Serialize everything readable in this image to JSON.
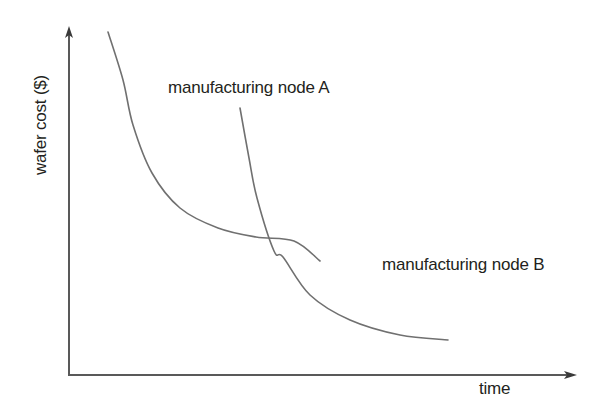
{
  "figure": {
    "background_color": "#ffffff",
    "width": 600,
    "height": 413
  },
  "axes": {
    "y_axis_label": "wafer cost ($)",
    "x_axis_label": "time",
    "axis_color": "#595959",
    "origin": {
      "x": 69,
      "y": 375
    },
    "y_axis_top": {
      "x": 69,
      "y": 29
    },
    "x_axis_end": {
      "x": 576,
      "y": 375
    },
    "arrowheads": "both-ends-outward"
  },
  "annotations": {
    "node_a_label": "manufacturing node A",
    "node_b_label": "manufacturing node B",
    "text_color": "#231f20"
  },
  "chart_data": {
    "type": "line",
    "title": "",
    "xlabel": "time",
    "ylabel": "wafer cost ($)",
    "grid": false,
    "legend": "inline-annotations",
    "axis_ticks": "none",
    "axis_scale": "qualitative",
    "xlim": [
      0,
      1
    ],
    "ylim": [
      0,
      1
    ],
    "curve_color": "#707070",
    "curve_width": 1.6,
    "series": [
      {
        "name": "manufacturing node A",
        "description": "learning-curve: wafer cost falls steeply then flattens; starts earlier in time at highest cost and settles to an intermediate cost plateau",
        "label_position": {
          "x": 168,
          "y": 78
        },
        "x": [
          0.077,
          0.1,
          0.121,
          0.16,
          0.219,
          0.298,
          0.377,
          0.456,
          0.496
        ],
        "y": [
          0.938,
          0.8,
          0.671,
          0.534,
          0.433,
          0.376,
          0.35,
          0.34,
          0.33
        ],
        "points_px": [
          [
            108,
            32
          ],
          [
            123,
            80
          ],
          [
            133,
            125
          ],
          [
            152,
            173
          ],
          [
            180,
            208
          ],
          [
            218,
            228
          ],
          [
            256,
            237
          ],
          [
            294,
            241
          ],
          [
            320,
            261
          ]
        ]
      },
      {
        "name": "manufacturing node B",
        "description": "learning-curve of the next node: starts later and lower than node A's start, drops steeply, crosses node A, and settles at a lower cost plateau",
        "label_position": {
          "x": 382,
          "y": 255
        },
        "x": [
          0.337,
          0.356,
          0.372,
          0.405,
          0.423,
          0.476,
          0.555,
          0.653,
          0.748
        ],
        "y": [
          0.716,
          0.572,
          0.457,
          0.305,
          0.255,
          0.174,
          0.118,
          0.076,
          0.065
        ],
        "points_px": [
          [
            240,
            108
          ],
          [
            249,
            158
          ],
          [
            257,
            198
          ],
          [
            274,
            251
          ],
          [
            283,
            257
          ],
          [
            310,
            295
          ],
          [
            350,
            320
          ],
          [
            400,
            335
          ],
          [
            448,
            340
          ]
        ]
      }
    ],
    "crossover_point_px": {
      "x": 283,
      "y": 257
    },
    "annotations_text": [
      "manufacturing node A",
      "manufacturing node B"
    ]
  }
}
